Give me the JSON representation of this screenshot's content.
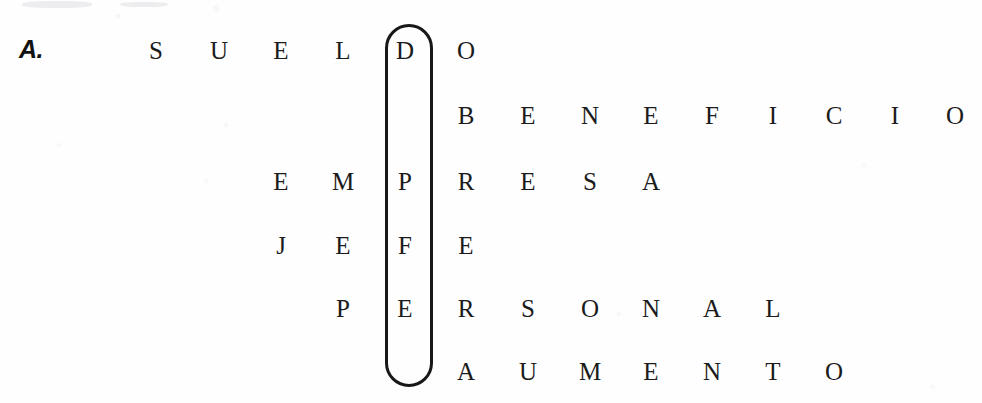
{
  "exercise": {
    "item_label": "A.",
    "key_word": "OBRERA",
    "key_column_index": 6
  },
  "puzzle": {
    "type": "acrostic-word-grid",
    "highlight_color": "#181818",
    "text_color": "#1b1b1b",
    "background_color": "#fefefe",
    "rows": [
      {
        "word": "SUELDO",
        "letters": [
          "S",
          "U",
          "E",
          "L",
          "D",
          "O"
        ],
        "start_col": 1,
        "key_letter": "O"
      },
      {
        "word": "BENEFICIOS",
        "letters": [
          "B",
          "E",
          "N",
          "E",
          "F",
          "I",
          "C",
          "I",
          "O",
          "S"
        ],
        "start_col": 6,
        "key_letter": "B"
      },
      {
        "word": "EMPRESA",
        "letters": [
          "E",
          "M",
          "P",
          "R",
          "E",
          "S",
          "A"
        ],
        "start_col": 3,
        "key_letter": "R"
      },
      {
        "word": "JEFE",
        "letters": [
          "J",
          "E",
          "F",
          "E"
        ],
        "start_col": 3,
        "key_letter": "E"
      },
      {
        "word": "PERSONAL",
        "letters": [
          "P",
          "E",
          "R",
          "S",
          "O",
          "N",
          "A",
          "L"
        ],
        "start_col": 4,
        "key_letter": "R"
      },
      {
        "word": "AUMENTO",
        "letters": [
          "A",
          "U",
          "M",
          "E",
          "N",
          "T",
          "O"
        ],
        "start_col": 6,
        "key_letter": "A"
      }
    ],
    "row_y": [
      50,
      115,
      181,
      245,
      308,
      371
    ],
    "col_x": [
      95,
      156,
      219,
      281,
      343,
      405,
      466,
      528,
      590,
      651,
      712,
      773,
      834,
      895,
      955
    ],
    "col_step": 61,
    "capsule": {
      "left": 385,
      "top": 24,
      "width": 48,
      "height": 363
    }
  }
}
